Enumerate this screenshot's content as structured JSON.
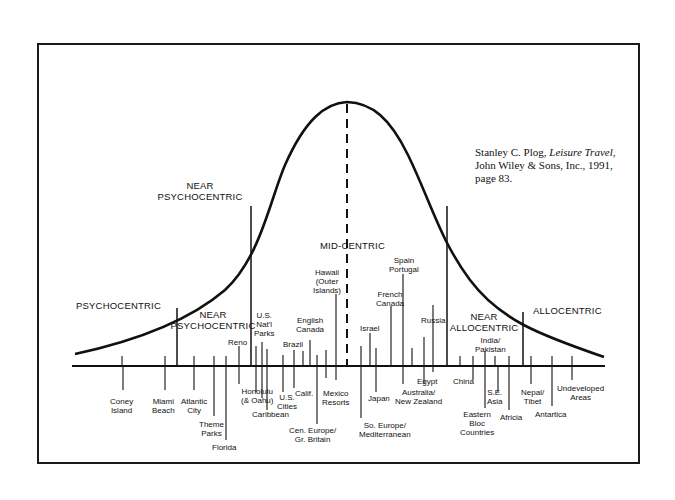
{
  "citation": {
    "author": "Stanley C. Plog, ",
    "title": "Leisure Travel",
    "line1_rest": ",",
    "line2": "John Wiley & Sons, Inc., 1991,",
    "line3": "page 83."
  },
  "zones": {
    "psychocentric": "PSYCHOCENTRIC",
    "near_psychocentric_upper": "NEAR\nPSYCHOCENTRIC",
    "near_psychocentric_lower": "NEAR\nPSYCHOCENTRIC",
    "mid_centric": "MID-CENTRIC",
    "near_allocentric": "NEAR\nALLOCENTRIC",
    "allocentric": "ALLOCENTRIC"
  },
  "destinations_above": [
    {
      "label": "Reno"
    },
    {
      "label": "U.S.\nNat'l\nParks"
    },
    {
      "label": "Brazil"
    },
    {
      "label": "English\nCanada"
    },
    {
      "label": "Hawaii\n(Outer\nIslands)"
    },
    {
      "label": "Israel"
    },
    {
      "label": "French\nCanada"
    },
    {
      "label": "Spain\nPortugal"
    },
    {
      "label": "Russia"
    },
    {
      "label": "India/\nPakistan"
    }
  ],
  "destinations_below": [
    {
      "label": "Coney\nIsland"
    },
    {
      "label": "Miami\nBeach"
    },
    {
      "label": "Atlantic\nCity"
    },
    {
      "label": "Theme\nParks"
    },
    {
      "label": "Florida"
    },
    {
      "label": "Honolulu\n(& Oahu)"
    },
    {
      "label": "Caribbean"
    },
    {
      "label": "U.S.\nCities"
    },
    {
      "label": "Calif."
    },
    {
      "label": "Cen. Europe/\nGr. Britain"
    },
    {
      "label": "Mexico\nResorts"
    },
    {
      "label": "So. Europe/\nMediterranean"
    },
    {
      "label": "Japan"
    },
    {
      "label": "Australia/\nNew Zealand"
    },
    {
      "label": "Egypt"
    },
    {
      "label": "China"
    },
    {
      "label": "Eastern\nBloc\nCountries"
    },
    {
      "label": "S.E.\nAsia"
    },
    {
      "label": "Africia"
    },
    {
      "label": "Nepal/\nTibet"
    },
    {
      "label": "Antartica"
    },
    {
      "label": "Undeveloped\nAreas"
    }
  ]
}
